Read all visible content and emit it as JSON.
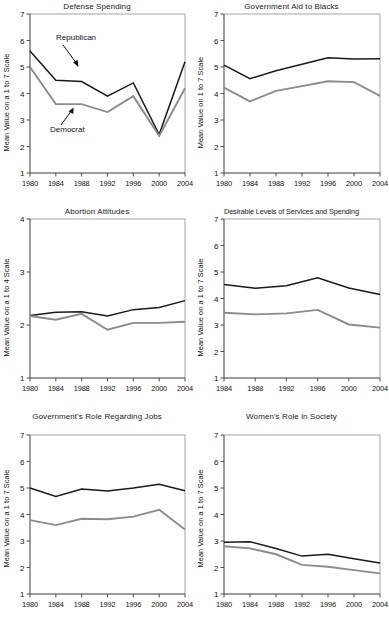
{
  "figure": {
    "name": "partisan-attitudes-small-multiples",
    "series_colors": {
      "republican": "#1a1a1a",
      "democrat": "#8c8c8c"
    },
    "annotations": {
      "republican_label": "Republican",
      "democrat_label": "Democrat"
    }
  },
  "chart_data": [
    {
      "id": "defense-spending",
      "type": "line",
      "title": "Defense Spending",
      "xlabel": "",
      "ylabel": "Mean Value on a 1 to 7 Scale",
      "x": [
        1980,
        1984,
        1988,
        1992,
        1996,
        2000,
        2004
      ],
      "xticklabels": [
        "1980",
        "1984",
        "1988",
        "1992",
        "1996",
        "2000",
        "2004"
      ],
      "ylim": [
        1,
        7
      ],
      "yticks": [
        1,
        2,
        3,
        4,
        5,
        6,
        7
      ],
      "grid": false,
      "legend": "annotated-arrows",
      "series": [
        {
          "name": "Republican",
          "color": "#1a1a1a",
          "values": [
            5.6,
            4.5,
            4.45,
            3.9,
            4.4,
            2.45,
            5.2
          ]
        },
        {
          "name": "Democrat",
          "color": "#8c8c8c",
          "values": [
            5.0,
            3.6,
            3.6,
            3.3,
            3.9,
            2.4,
            4.2
          ]
        }
      ],
      "annotations": [
        {
          "text": "Republican",
          "arrow": true
        },
        {
          "text": "Democrat",
          "arrow": true
        }
      ]
    },
    {
      "id": "government-aid-to-blacks",
      "type": "line",
      "title": "Government Aid to Blacks",
      "xlabel": "",
      "ylabel": "Mean Value on 1 to 7 Scale",
      "x": [
        1980,
        1984,
        1988,
        1992,
        1996,
        2000,
        2004
      ],
      "xticklabels": [
        "1980",
        "1984",
        "1988",
        "1992",
        "1996",
        "2000",
        "2004"
      ],
      "ylim": [
        1,
        7
      ],
      "yticks": [
        1,
        2,
        3,
        4,
        5,
        6,
        7
      ],
      "grid": false,
      "series": [
        {
          "name": "Democrat",
          "color": "#1a1a1a",
          "values": [
            5.07,
            4.56,
            4.86,
            5.1,
            5.35,
            5.3,
            5.31
          ]
        },
        {
          "name": "Republican",
          "color": "#8c8c8c",
          "values": [
            4.22,
            3.7,
            4.1,
            4.28,
            4.46,
            4.43,
            3.91
          ]
        }
      ]
    },
    {
      "id": "abortion-attitudes",
      "type": "line",
      "title": "Abortion Attitudes",
      "xlabel": "",
      "ylabel": "Mean Value on a 1 to 4 Scale",
      "x": [
        1980,
        1984,
        1988,
        1992,
        1996,
        2000,
        2004
      ],
      "xticklabels": [
        "1980",
        "1984",
        "1988",
        "1992",
        "1996",
        "2000",
        "2004"
      ],
      "ylim": [
        1,
        4
      ],
      "yticks": [
        1,
        2,
        3,
        4
      ],
      "grid": false,
      "series": [
        {
          "name": "Democrat",
          "color": "#1a1a1a",
          "values": [
            2.18,
            2.24,
            2.25,
            2.17,
            2.29,
            2.33,
            2.46
          ]
        },
        {
          "name": "Republican",
          "color": "#8c8c8c",
          "values": [
            2.17,
            2.1,
            2.21,
            1.91,
            2.04,
            2.04,
            2.06
          ]
        }
      ]
    },
    {
      "id": "desirable-levels-of-services-and-spending",
      "type": "line",
      "title": "Desirable Levels of Services and Spending",
      "xlabel": "",
      "ylabel": "Mean Value on a 1 to 7 Scale",
      "x": [
        1984,
        1988,
        1992,
        1996,
        2000,
        2004
      ],
      "xticklabels": [
        "1984",
        "1988",
        "1992",
        "1996",
        "2000",
        "2004"
      ],
      "ylim": [
        1,
        7
      ],
      "yticks": [
        1,
        2,
        3,
        4,
        5,
        6,
        7
      ],
      "grid": false,
      "series": [
        {
          "name": "Democrat",
          "color": "#1a1a1a",
          "values": [
            4.53,
            4.39,
            4.48,
            4.78,
            4.4,
            4.15
          ]
        },
        {
          "name": "Republican",
          "color": "#8c8c8c",
          "values": [
            3.46,
            3.4,
            3.44,
            3.57,
            3.02,
            2.9
          ]
        }
      ]
    },
    {
      "id": "governments-role-regarding-jobs",
      "type": "line",
      "title": "Government's Role Regarding Jobs",
      "xlabel": "",
      "ylabel": "Mean Value on a 1 to 7 Scale",
      "x": [
        1980,
        1984,
        1988,
        1992,
        1996,
        2000,
        2004
      ],
      "xticklabels": [
        "1980",
        "1984",
        "1988",
        "1992",
        "1996",
        "2000",
        "2004"
      ],
      "ylim": [
        1,
        7
      ],
      "yticks": [
        1,
        2,
        3,
        4,
        5,
        6,
        7
      ],
      "grid": false,
      "series": [
        {
          "name": "Democrat",
          "color": "#1a1a1a",
          "values": [
            5.0,
            4.68,
            4.96,
            4.89,
            5.0,
            5.14,
            4.9
          ]
        },
        {
          "name": "Republican",
          "color": "#8c8c8c",
          "values": [
            3.79,
            3.6,
            3.84,
            3.82,
            3.92,
            4.18,
            3.43
          ]
        }
      ]
    },
    {
      "id": "womens-role-in-society",
      "type": "line",
      "title": "Women's Role in Society",
      "xlabel": "",
      "ylabel": "Mean Value on a 1 to 7 Scale",
      "x": [
        1980,
        1984,
        1988,
        1992,
        1996,
        2000,
        2004
      ],
      "xticklabels": [
        "1980",
        "1984",
        "1988",
        "1992",
        "1996",
        "2000",
        "2004"
      ],
      "ylim": [
        1,
        7
      ],
      "yticks": [
        1,
        2,
        3,
        4,
        5,
        6,
        7
      ],
      "grid": false,
      "series": [
        {
          "name": "Republican",
          "color": "#1a1a1a",
          "values": [
            2.95,
            2.97,
            2.72,
            2.43,
            2.5,
            2.33,
            2.17
          ]
        },
        {
          "name": "Democrat",
          "color": "#8c8c8c",
          "values": [
            2.8,
            2.72,
            2.5,
            2.1,
            2.03,
            1.9,
            1.78
          ]
        }
      ]
    }
  ]
}
